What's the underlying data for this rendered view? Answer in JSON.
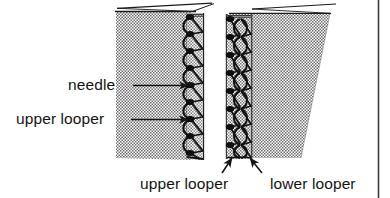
{
  "figure": {
    "kind": "serger-stitch-diagram",
    "background_color": "#ffffff",
    "fabric_fill_color": "#8e8e8e",
    "ink_color": "#141414",
    "page_border_color": "#3a3a3a"
  },
  "labels": {
    "needle": "needle",
    "upper_looper_left": "upper looper",
    "upper_looper_bottom": "upper looper",
    "lower_looper_bottom": "lower looper"
  },
  "callouts": [
    {
      "name": "needle",
      "text": "needle",
      "arrow": "horizontal-right",
      "target": "left-panel-seam"
    },
    {
      "name": "upper-looper-left",
      "text": "upper looper",
      "arrow": "horizontal-right",
      "target": "left-panel-seam"
    },
    {
      "name": "upper-looper-bottom",
      "text": "upper looper",
      "arrow": "diagonal-up-right",
      "target": "right-panel-seam-left"
    },
    {
      "name": "lower-looper-bottom",
      "text": "lower looper",
      "arrow": "diagonal-up-left",
      "target": "right-panel-seam-right"
    }
  ],
  "panels": [
    {
      "name": "left-fabric-panel",
      "edge_finished": "right",
      "shape": "rectangular"
    },
    {
      "name": "right-fabric-panel",
      "edge_finished": "left",
      "shape": "tapered-narrowing-downward"
    }
  ]
}
